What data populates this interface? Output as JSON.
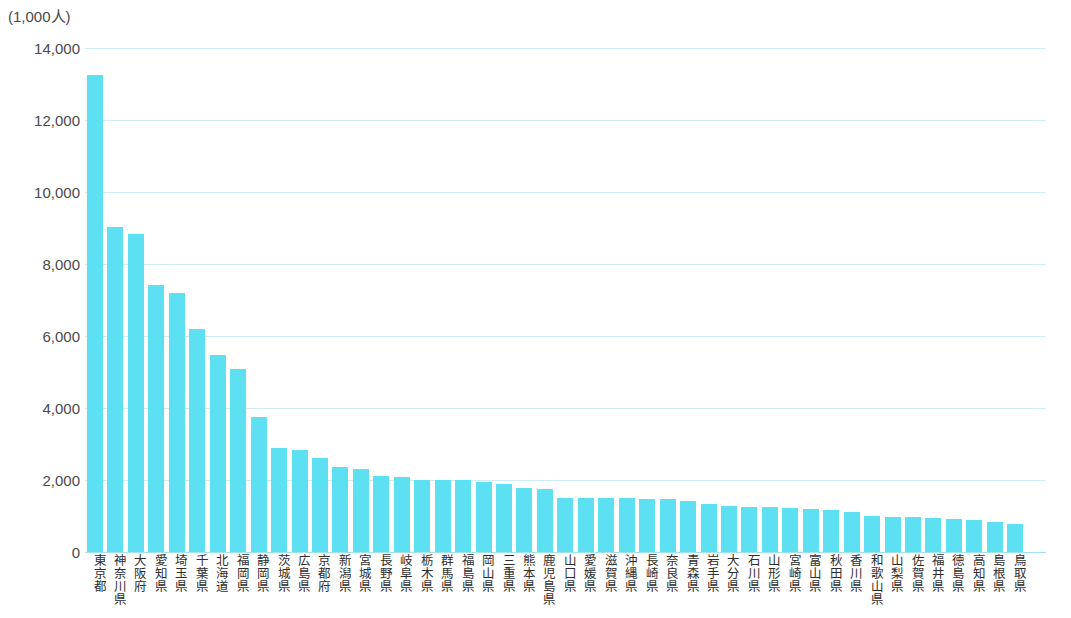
{
  "chart_data": {
    "type": "bar",
    "title": "",
    "subtitle": "",
    "xlabel": "",
    "ylabel": "",
    "unit_label": "(1,000人)",
    "ylim": [
      0,
      14000
    ],
    "ytick_labels": [
      "14,000",
      "12,000",
      "10,000",
      "8,000",
      "6,000",
      "4,000",
      "2,000",
      "0"
    ],
    "ytick_values": [
      14000,
      12000,
      10000,
      8000,
      6000,
      4000,
      2000,
      0
    ],
    "grid": true,
    "legend": "none",
    "bar_color": "#5ce0f2",
    "gridline_color": "#cdeef6",
    "categories": [
      "東京都",
      "神奈川県",
      "大阪府",
      "愛知県",
      "埼玉県",
      "千葉県",
      "北海道",
      "福岡県",
      "静岡県",
      "茨城県",
      "広島県",
      "京都府",
      "新潟県",
      "宮城県",
      "長野県",
      "岐阜県",
      "栃木県",
      "群馬県",
      "福島県",
      "岡山県",
      "三重県",
      "熊本県",
      "鹿児島県",
      "山口県",
      "愛媛県",
      "滋賀県",
      "沖縄県",
      "長崎県",
      "奈良県",
      "青森県",
      "岩手県",
      "大分県",
      "石川県",
      "山形県",
      "宮崎県",
      "富山県",
      "秋田県",
      "香川県",
      "和歌山県",
      "山梨県",
      "佐賀県",
      "福井県",
      "徳島県",
      "高知県",
      "島根県",
      "鳥取県"
    ],
    "values": [
      13250,
      9040,
      8820,
      7430,
      7200,
      6200,
      5480,
      5090,
      3740,
      2900,
      2840,
      2620,
      2370,
      2300,
      2100,
      2080,
      2010,
      2000,
      1990,
      1940,
      1880,
      1790,
      1740,
      1500,
      1490,
      1490,
      1490,
      1480,
      1470,
      1430,
      1330,
      1280,
      1260,
      1250,
      1220,
      1190,
      1180,
      1110,
      1000,
      970,
      960,
      940,
      920,
      890,
      840,
      780
    ]
  }
}
